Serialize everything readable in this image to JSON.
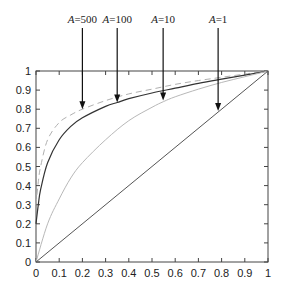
{
  "chart_data": {
    "type": "line",
    "title": "",
    "xlabel": "",
    "ylabel": "",
    "xlim": [
      0,
      1
    ],
    "ylim": [
      0,
      1
    ],
    "grid": false,
    "legend": "none (curves labeled by arrows above plot)",
    "x_ticks": [
      "0",
      "0.1",
      "0.2",
      "0.3",
      "0.4",
      "0.5",
      "0.6",
      "0.7",
      "0.8",
      "0.9",
      "1"
    ],
    "y_ticks": [
      "0",
      "0.1",
      "0.2",
      "0.3",
      "0.4",
      "0.5",
      "0.6",
      "0.7",
      "0.8",
      "0.9",
      "1"
    ],
    "series": [
      {
        "name": "A=500",
        "style": "dashed",
        "color": "#b0b0b0",
        "x": [
          0,
          0.01,
          0.02,
          0.05,
          0.1,
          0.15,
          0.2,
          0.3,
          0.4,
          0.5,
          0.6,
          0.7,
          0.8,
          0.9,
          1
        ],
        "y": [
          0.3,
          0.42,
          0.5,
          0.64,
          0.73,
          0.77,
          0.8,
          0.845,
          0.88,
          0.905,
          0.93,
          0.95,
          0.967,
          0.984,
          1
        ]
      },
      {
        "name": "A=100",
        "style": "solid",
        "color": "#333333",
        "x": [
          0,
          0.01,
          0.02,
          0.05,
          0.1,
          0.15,
          0.2,
          0.3,
          0.35,
          0.4,
          0.5,
          0.6,
          0.7,
          0.8,
          0.9,
          1
        ],
        "y": [
          0.2,
          0.3,
          0.38,
          0.52,
          0.64,
          0.71,
          0.755,
          0.815,
          0.835,
          0.855,
          0.885,
          0.91,
          0.935,
          0.957,
          0.978,
          1
        ]
      },
      {
        "name": "A=10",
        "style": "solid",
        "color": "#b8b8b8",
        "x": [
          0,
          0.05,
          0.1,
          0.15,
          0.2,
          0.3,
          0.4,
          0.5,
          0.55,
          0.6,
          0.7,
          0.8,
          0.9,
          1
        ],
        "y": [
          0,
          0.2,
          0.33,
          0.44,
          0.52,
          0.64,
          0.74,
          0.81,
          0.84,
          0.865,
          0.905,
          0.94,
          0.97,
          1
        ]
      },
      {
        "name": "A=1",
        "style": "solid",
        "color": "#555555",
        "x": [
          0,
          1
        ],
        "y": [
          0,
          1
        ]
      }
    ],
    "annotations": [
      {
        "label_prefix": "A",
        "label_value": "=500",
        "arrow_x": 0.2,
        "arrow_tip_y": 0.8,
        "target": "A=500"
      },
      {
        "label_prefix": "A",
        "label_value": "=100",
        "arrow_x": 0.35,
        "arrow_tip_y": 0.835,
        "target": "A=100"
      },
      {
        "label_prefix": "A",
        "label_value": "=10",
        "arrow_x": 0.548,
        "arrow_tip_y": 0.845,
        "target": "A=10"
      },
      {
        "label_prefix": "A",
        "label_value": "=1",
        "arrow_x": 0.785,
        "arrow_tip_y": 0.79,
        "target": "A=1"
      }
    ]
  },
  "layout": {
    "plot_left": 36,
    "plot_top": 71,
    "plot_width": 232,
    "plot_height": 191,
    "label_y": 23,
    "arrow_start_y": 28
  }
}
